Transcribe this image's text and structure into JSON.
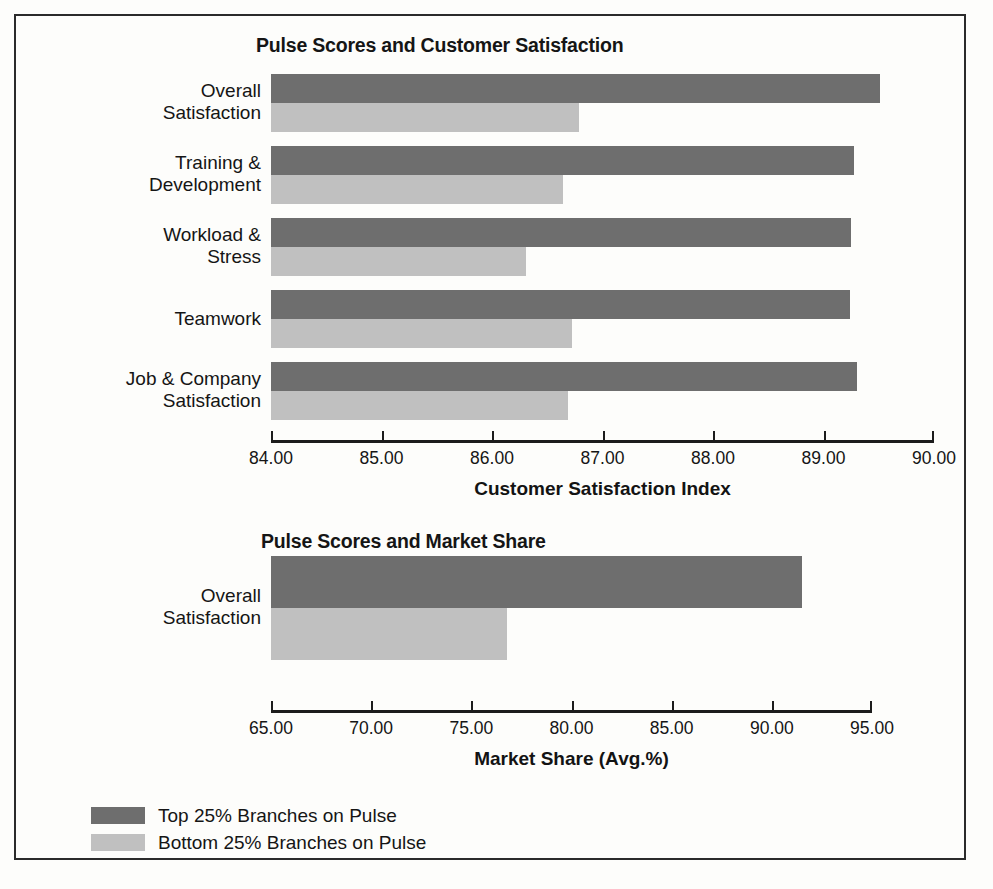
{
  "figure": {
    "background": "#fdfdfb",
    "color_top": "#6e6e6e",
    "color_bottom": "#c0c0c0"
  },
  "legend": {
    "items": [
      {
        "label": "Top 25% Branches on Pulse",
        "color": "#6e6e6e",
        "key": "top"
      },
      {
        "label": "Bottom 25% Branches on Pulse",
        "color": "#c0c0c0",
        "key": "bottom"
      }
    ]
  },
  "chart_data": [
    {
      "type": "bar",
      "orientation": "horizontal",
      "title": "Pulse Scores and Customer Satisfaction",
      "xlabel": "Customer Satisfaction Index",
      "ylabel": "",
      "xlim": [
        84.0,
        90.0
      ],
      "xticks": [
        84.0,
        85.0,
        86.0,
        87.0,
        88.0,
        89.0,
        90.0
      ],
      "xticklabels": [
        "84.00",
        "85.00",
        "86.00",
        "87.00",
        "88.00",
        "89.00",
        "90.00"
      ],
      "grid": false,
      "legend_position": "bottom-left",
      "categories": [
        "Overall\nSatisfaction",
        "Training &\nDevelopment",
        "Workload &\nStress",
        "Teamwork",
        "Job & Company\nSatisfaction"
      ],
      "category_lines": [
        [
          "Overall",
          "Satisfaction"
        ],
        [
          "Training &",
          "Development"
        ],
        [
          "Workload &",
          "Stress"
        ],
        [
          "Teamwork"
        ],
        [
          "Job & Company",
          "Satisfaction"
        ]
      ],
      "series": [
        {
          "name": "Top 25% Branches on Pulse",
          "key": "top",
          "color": "#6e6e6e",
          "values": [
            89.51,
            89.28,
            89.25,
            89.24,
            89.3
          ]
        },
        {
          "name": "Bottom 25% Branches on Pulse",
          "key": "bottom",
          "color": "#c0c0c0",
          "values": [
            86.79,
            86.64,
            86.31,
            86.72,
            86.69
          ]
        }
      ]
    },
    {
      "type": "bar",
      "orientation": "horizontal",
      "title": "Pulse Scores and Market Share",
      "xlabel": "Market Share (Avg.%)",
      "ylabel": "",
      "xlim": [
        65.0,
        95.0
      ],
      "xticks": [
        65.0,
        70.0,
        75.0,
        80.0,
        85.0,
        90.0,
        95.0
      ],
      "xticklabels": [
        "65.00",
        "70.00",
        "75.00",
        "80.00",
        "85.00",
        "90.00",
        "95.00"
      ],
      "grid": false,
      "legend_position": "bottom-left",
      "categories": [
        "Overall\nSatisfaction"
      ],
      "category_lines": [
        [
          "Overall",
          "Satisfaction"
        ]
      ],
      "series": [
        {
          "name": "Top 25% Branches on Pulse",
          "key": "top",
          "color": "#6e6e6e",
          "values": [
            91.5
          ]
        },
        {
          "name": "Bottom 25% Branches on Pulse",
          "key": "bottom",
          "color": "#c0c0c0",
          "values": [
            76.8
          ]
        }
      ]
    }
  ]
}
